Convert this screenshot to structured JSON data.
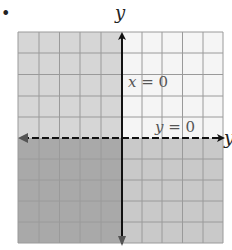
{
  "figure": {
    "bullet": "•",
    "y_axis_label": "y",
    "x_axis_label": "y",
    "line_labels": [
      {
        "var": "x",
        "op": " = ",
        "val": "0"
      },
      {
        "var": "y",
        "op": " = ",
        "val": "0"
      }
    ]
  },
  "grid": {
    "columns": 10,
    "rows": 10,
    "shading": {
      "upper_left": "#d4d4d4",
      "upper_right": "#f4f4f4",
      "lower_left": "#a8a8a8",
      "lower_right": "#c8c8c8"
    },
    "grid_line_color": "#999999",
    "axis_color": "#111111"
  },
  "description": {
    "x_axis_style": "dashed with arrows both ends",
    "y_axis_style": "solid with arrows both ends",
    "shaded_regions": "x<=0 shaded light gray; y<=0 shaded gray; overlap darker"
  }
}
